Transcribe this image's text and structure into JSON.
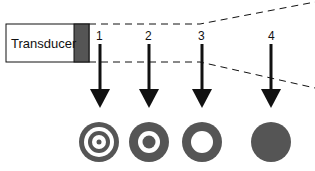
{
  "diagram": {
    "transducer_label": "Transducer",
    "zones": [
      {
        "number": "1",
        "pattern": "multiple concentric rings"
      },
      {
        "number": "2",
        "pattern": "ring with center dot"
      },
      {
        "number": "3",
        "pattern": "single ring"
      },
      {
        "number": "4",
        "pattern": "solid disc"
      }
    ],
    "colors": {
      "stroke": "#111111",
      "element": "#555555",
      "pattern_fill": "#555555",
      "background": "#ffffff"
    }
  }
}
